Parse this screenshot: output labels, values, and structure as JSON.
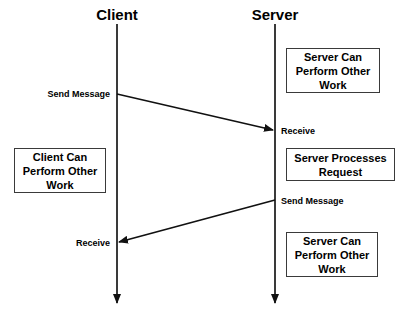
{
  "diagram": {
    "type": "sequence-diagram",
    "background_color": "#ffffff",
    "line_color": "#1a1a1a",
    "box_border_color": "#3a3a3a",
    "lifelines": [
      {
        "id": "client",
        "title": "Client",
        "x": 117,
        "top": 24,
        "bottom": 312
      },
      {
        "id": "server",
        "title": "Server",
        "x": 275,
        "top": 24,
        "bottom": 312
      }
    ],
    "notes": [
      {
        "id": "server-note-top",
        "text": "Server Can Perform Other Work",
        "lines": [
          "Server Can",
          "Perform Other",
          "Work"
        ],
        "x": 286,
        "y": 48,
        "w": 94,
        "h": 45
      },
      {
        "id": "client-note",
        "text": "Client Can Perform Other Work",
        "lines": [
          "Client Can",
          "Perform Other",
          "Work"
        ],
        "x": 14,
        "y": 148,
        "w": 92,
        "h": 45
      },
      {
        "id": "server-note-processing",
        "text": "Server Processes Request",
        "lines": [
          "Server Processes",
          "Request"
        ],
        "x": 286,
        "y": 148,
        "w": 109,
        "h": 33
      },
      {
        "id": "server-note-bottom",
        "text": "Server Can Perform Other Work",
        "lines": [
          "Server Can",
          "Perform Other",
          "Work"
        ],
        "x": 286,
        "y": 232,
        "w": 92,
        "h": 45
      }
    ],
    "messages": [
      {
        "id": "request",
        "label": "Send Message",
        "from": "client",
        "to": "server",
        "from_x": 117,
        "from_y": 94,
        "to_x": 275,
        "to_y": 131,
        "label_x": 110,
        "label_y": 89,
        "label_align": "right"
      },
      {
        "id": "request-received",
        "label": "Receive",
        "anchor": "server",
        "label_x": 281,
        "label_y": 126,
        "label_align": "left"
      },
      {
        "id": "response",
        "label": "Send Message",
        "from": "server",
        "to": "client",
        "from_x": 275,
        "from_y": 200,
        "to_x": 117,
        "to_y": 243,
        "label_x": 281,
        "label_y": 196,
        "label_align": "left"
      },
      {
        "id": "response-received",
        "label": "Receive",
        "anchor": "client",
        "label_x": 110,
        "label_y": 238,
        "label_align": "right"
      }
    ]
  }
}
